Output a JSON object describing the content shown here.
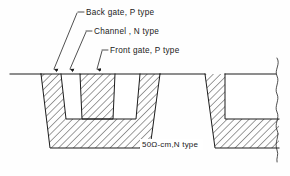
{
  "figure": {
    "background_color": "#fefefe",
    "line_color": "#1c1c1c",
    "hatch_color": "#1c1c1c",
    "annotations": [
      {
        "id": "back-gate",
        "label": "Back gate, P type",
        "text_x": 86,
        "text_y": 15,
        "dash_x1": 78,
        "dash_x2": 84,
        "dash_y": 12,
        "leader_x1": 77,
        "leader_y1": 13,
        "leader_x2": 54,
        "leader_y2": 70,
        "arrow_x": 54,
        "arrow_y": 74
      },
      {
        "id": "channel",
        "label": "Channel , N type",
        "text_x": 94,
        "text_y": 34,
        "dash_x1": 86,
        "dash_x2": 92,
        "dash_y": 31,
        "leader_x1": 86,
        "leader_y1": 32,
        "leader_x2": 70,
        "leader_y2": 70,
        "arrow_x": 70,
        "arrow_y": 74
      },
      {
        "id": "front-gate",
        "label": "Front gate, P type",
        "text_x": 110,
        "text_y": 53,
        "dash_x1": 102,
        "dash_x2": 108,
        "dash_y": 50,
        "leader_x1": 102,
        "leader_y1": 51,
        "leader_x2": 97,
        "leader_y2": 70,
        "arrow_x": 97,
        "arrow_y": 74
      }
    ],
    "substrate_label": {
      "id": "substrate",
      "text": "50Ω-cm,N type",
      "text_x": 142,
      "text_y": 147
    },
    "regions": {
      "surface_line_y": 74,
      "trench_bottom_y": 148,
      "left_structure": {
        "name": "left-trench-body",
        "outer_left_top_x": 41,
        "outer_left_bottom_x": 50,
        "outer_right_top_x": 160,
        "outer_right_bottom_x": 150
      },
      "right_structure": {
        "name": "right-trench-body",
        "wall_left_top_x": 205,
        "wall_left_bottom_x": 215,
        "right_edge_x": 279
      },
      "front_gate_pillar": {
        "name": "front-gate-pillar",
        "top_left_x": 80,
        "top_right_x": 115,
        "bottom_left_x": 82,
        "bottom_right_x": 113,
        "bottom_y": 119
      }
    }
  }
}
